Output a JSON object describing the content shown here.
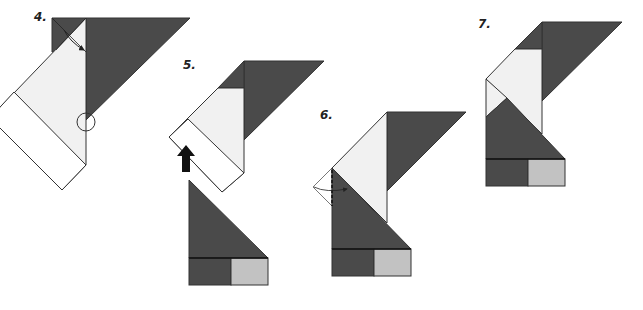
{
  "colors": {
    "dark": "#4a4a4a",
    "light": "#f1f1f1",
    "white": "#ffffff",
    "mid_gray": "#c2c2c2",
    "outline": "#333333"
  },
  "steps": [
    {
      "number": "4.",
      "description": "Fold the flap down along the diagonal; valley fold point marked with a circle"
    },
    {
      "number": "5.",
      "description": "Move the lower part up as shown by the arrow"
    },
    {
      "number": "6.",
      "description": "Fold the left corner in along the dashed line"
    },
    {
      "number": "7.",
      "description": "Completed result"
    }
  ]
}
